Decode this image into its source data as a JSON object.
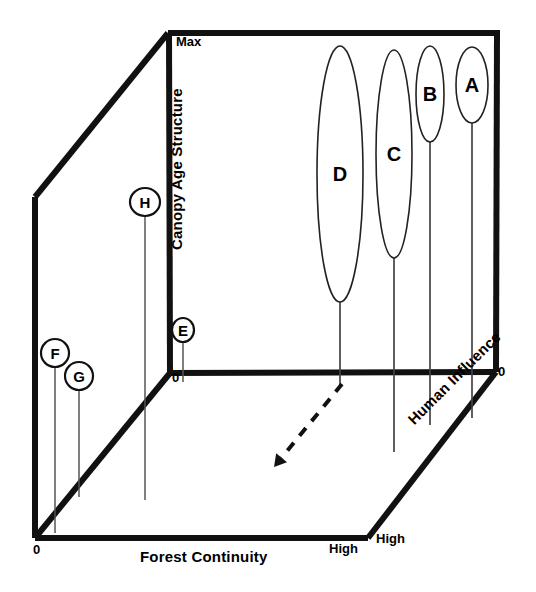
{
  "figure": {
    "type": "conceptual-3d-scatter-diagram",
    "background": "#ffffff",
    "line_color": "#111111"
  },
  "axes": {
    "x": {
      "title": "Forest Continuity",
      "min_label": "0",
      "max_label": "High"
    },
    "y": {
      "title": "Canopy Age Structure",
      "min_label": "0",
      "max_label": "Max"
    },
    "z": {
      "title": "Human Influence",
      "min_label": "0",
      "max_label": "High"
    }
  },
  "chart_data": {
    "type": "scatter",
    "title": "",
    "xlabel": "Forest Continuity",
    "ylabel": "Canopy Age Structure",
    "zlabel": "Human Influence",
    "xlim": [
      "0",
      "High"
    ],
    "ylim": [
      "0",
      "Max"
    ],
    "zlim": [
      "0",
      "High"
    ],
    "grid": false,
    "legend": "none",
    "markers": [
      {
        "label": "A",
        "shape": "ellipse",
        "cx": 472,
        "cy": 85,
        "rx": 16,
        "ry": 38,
        "stem_from_y": 123,
        "stem_to_y": 418,
        "font_size": 20
      },
      {
        "label": "B",
        "shape": "ellipse",
        "cx": 430,
        "cy": 94,
        "rx": 14,
        "ry": 48,
        "stem_from_y": 142,
        "stem_to_y": 425,
        "font_size": 20
      },
      {
        "label": "C",
        "shape": "ellipse",
        "cx": 394,
        "cy": 154,
        "rx": 18,
        "ry": 104,
        "stem_from_y": 258,
        "stem_to_y": 452,
        "font_size": 20
      },
      {
        "label": "D",
        "shape": "ellipse",
        "cx": 340,
        "cy": 174,
        "rx": 23,
        "ry": 128,
        "stem_from_y": 302,
        "stem_to_y": 385,
        "font_size": 20
      },
      {
        "label": "E",
        "shape": "circle",
        "cx": 183,
        "cy": 330,
        "rx": 11,
        "ry": 12,
        "stem_from_y": 342,
        "stem_to_y": 382,
        "font_size": 15
      },
      {
        "label": "F",
        "shape": "circle",
        "cx": 55,
        "cy": 353,
        "rx": 14,
        "ry": 14,
        "stem_from_y": 367,
        "stem_to_y": 533,
        "font_size": 17
      },
      {
        "label": "G",
        "shape": "circle",
        "cx": 79,
        "cy": 376,
        "rx": 14,
        "ry": 14,
        "stem_from_y": 390,
        "stem_to_y": 497,
        "font_size": 17
      },
      {
        "label": "H",
        "shape": "circle",
        "cx": 145,
        "cy": 202,
        "rx": 15,
        "ry": 14,
        "stem_from_y": 216,
        "stem_to_y": 500,
        "font_size": 17
      }
    ],
    "annotations": [
      {
        "name": "trend-arrow",
        "style": "dashed-arrow",
        "from": [
          342,
          384
        ],
        "to": [
          274,
          467
        ],
        "meaning": "direction of change"
      }
    ]
  }
}
